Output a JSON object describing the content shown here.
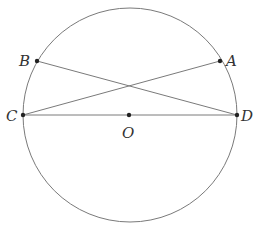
{
  "diagram": {
    "type": "circle-geometry",
    "canvas": {
      "width": 255,
      "height": 241
    },
    "colors": {
      "stroke": "#7a7a7a",
      "point": "#222222",
      "label": "#333333",
      "background": "#ffffff"
    },
    "circle": {
      "cx": 130,
      "cy": 115,
      "r": 107
    },
    "points": {
      "A": {
        "label": "A",
        "x": 220,
        "y": 61
      },
      "B": {
        "label": "B",
        "x": 37,
        "y": 61
      },
      "C": {
        "label": "C",
        "x": 23,
        "y": 115
      },
      "D": {
        "label": "D",
        "x": 237,
        "y": 115
      },
      "O": {
        "label": "O",
        "x": 129,
        "y": 115
      }
    },
    "segments": [
      {
        "from": "C",
        "to": "D",
        "name": "diameter-CD"
      },
      {
        "from": "C",
        "to": "A",
        "name": "chord-CA"
      },
      {
        "from": "B",
        "to": "D",
        "name": "chord-BD"
      }
    ],
    "label_positions": {
      "A": {
        "x": 226,
        "y": 66
      },
      "B": {
        "x": 19,
        "y": 66
      },
      "C": {
        "x": 6,
        "y": 121
      },
      "D": {
        "x": 241,
        "y": 121
      },
      "O": {
        "x": 122,
        "y": 138
      }
    }
  }
}
